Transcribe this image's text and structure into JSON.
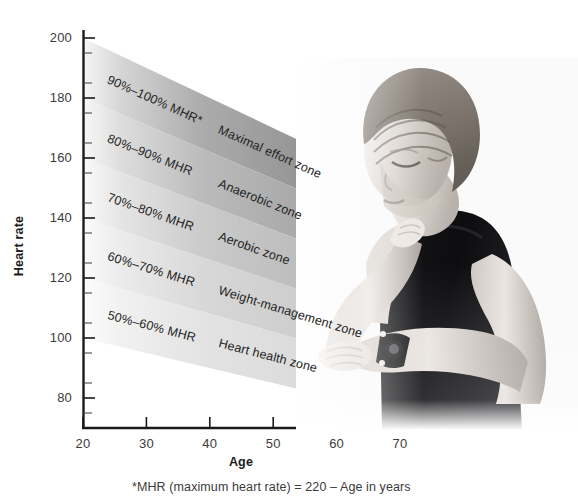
{
  "figure": {
    "footnote": "*MHR (maximum heart rate) = 220 – Age in years"
  },
  "axes": {
    "y": {
      "title": "Heart rate",
      "ticks": [
        "200",
        "180",
        "160",
        "140",
        "120",
        "100",
        "80"
      ],
      "tick_values": [
        200,
        180,
        160,
        140,
        120,
        100,
        80
      ],
      "minor_step": 10,
      "range": [
        70,
        205
      ]
    },
    "x": {
      "title": "Age",
      "ticks": [
        "20",
        "30",
        "40",
        "50",
        "60",
        "70"
      ],
      "tick_values": [
        20,
        30,
        40,
        50,
        60,
        70
      ],
      "range": [
        20,
        70
      ]
    }
  },
  "bands": [
    {
      "pct_label": "90%–100% MHR*",
      "zone_label": "Maximal effort zone",
      "pct_low": 90,
      "pct_high": 100,
      "color": "#8e8e8e",
      "hr_at_20": [
        180,
        200
      ],
      "hr_at_70": [
        135,
        150
      ]
    },
    {
      "pct_label": "80%–90% MHR",
      "zone_label": "Anaerobic zone",
      "pct_low": 80,
      "pct_high": 90,
      "color": "#a3a3a3",
      "hr_at_20": [
        160,
        180
      ],
      "hr_at_70": [
        120,
        135
      ]
    },
    {
      "pct_label": "70%–80% MHR",
      "zone_label": "Aerobic zone",
      "pct_low": 70,
      "pct_high": 80,
      "color": "#b8b8b8",
      "hr_at_20": [
        140,
        160
      ],
      "hr_at_70": [
        105,
        120
      ]
    },
    {
      "pct_label": "60%–70% MHR",
      "zone_label": "Weight-management zone",
      "pct_low": 60,
      "pct_high": 70,
      "color": "#cacaca",
      "hr_at_20": [
        120,
        140
      ],
      "hr_at_70": [
        90,
        105
      ]
    },
    {
      "pct_label": "50%–60% MHR",
      "zone_label": "Heart health zone",
      "pct_low": 50,
      "pct_high": 60,
      "color": "#d9d9d9",
      "hr_at_20": [
        100,
        120
      ],
      "hr_at_70": [
        75,
        90
      ]
    }
  ],
  "photo": {
    "alt": "Grayscale photograph of a woman in a black sports top checking her pulse at her neck while looking at a wristwatch",
    "name": "woman-checking-pulse-photo"
  },
  "chart_data": {
    "type": "area",
    "xlabel": "Age",
    "ylabel": "Heart rate",
    "xlim": [
      20,
      70
    ],
    "ylim": [
      70,
      205
    ],
    "xticks": [
      20,
      30,
      40,
      50,
      60,
      70
    ],
    "yticks": [
      80,
      100,
      120,
      140,
      160,
      180,
      200
    ],
    "grid": false,
    "legend": "inline band labels",
    "note": "MHR (maximum heart rate) = 220 - Age in years; each band spans pct_low%-pct_high% of MHR",
    "x": [
      20,
      70
    ],
    "series": [
      {
        "name": "90%-100% MHR (Maximal effort zone)",
        "lower": [
          180,
          135
        ],
        "upper": [
          200,
          150
        ],
        "color": "#8e8e8e"
      },
      {
        "name": "80%-90% MHR (Anaerobic zone)",
        "lower": [
          160,
          120
        ],
        "upper": [
          180,
          135
        ],
        "color": "#a3a3a3"
      },
      {
        "name": "70%-80% MHR (Aerobic zone)",
        "lower": [
          140,
          105
        ],
        "upper": [
          160,
          120
        ],
        "color": "#b8b8b8"
      },
      {
        "name": "60%-70% MHR (Weight-management zone)",
        "lower": [
          120,
          90
        ],
        "upper": [
          140,
          105
        ],
        "color": "#cacaca"
      },
      {
        "name": "50%-60% MHR (Heart health zone)",
        "lower": [
          100,
          75
        ],
        "upper": [
          120,
          90
        ],
        "color": "#d9d9d9"
      }
    ]
  }
}
